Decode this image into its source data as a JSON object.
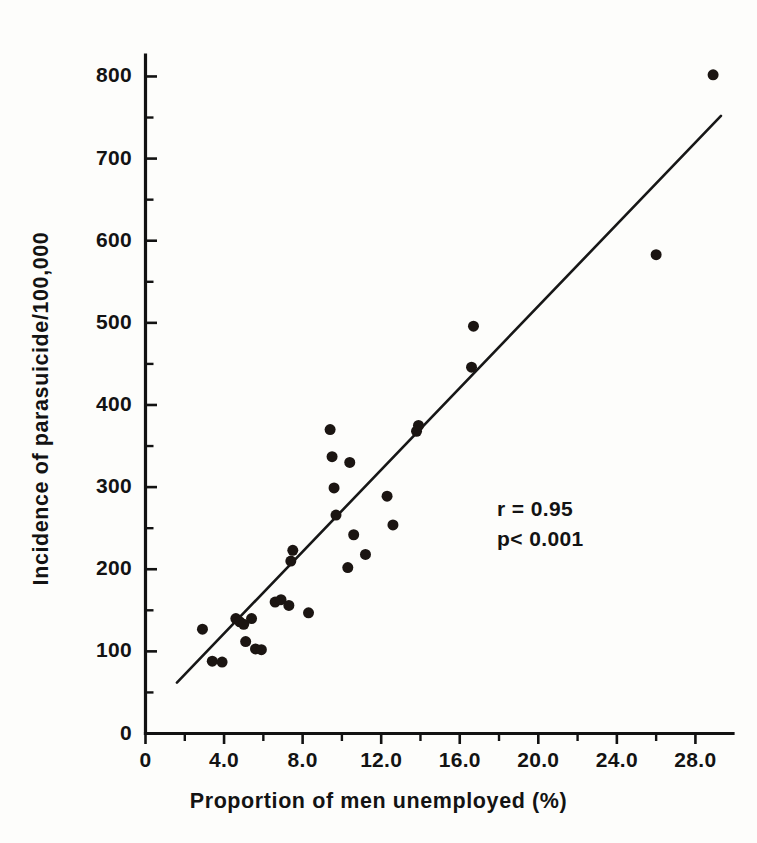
{
  "figure": {
    "background_color": "#fdfdfb",
    "ink_color": "#131313"
  },
  "annotations": {
    "correlation": "r = 0.95",
    "pvalue": "p< 0.001"
  },
  "axes": {
    "y_title": "Incidence of parasuicide/100,000",
    "x_title": "Proportion of men unemployed (%)",
    "y_ticks": [
      "0",
      "100",
      "200",
      "300",
      "400",
      "500",
      "600",
      "700",
      "800"
    ],
    "x_ticks": [
      "0",
      "4.0",
      "8.0",
      "12.0",
      "16.0",
      "20.0",
      "24.0",
      "28.0"
    ]
  },
  "chart_data": {
    "type": "scatter",
    "title": "",
    "xlabel": "Proportion of men unemployed (%)",
    "ylabel": "Incidence of parasuicide/100,000",
    "xlim": [
      0,
      30
    ],
    "ylim": [
      0,
      850
    ],
    "grid": false,
    "legend": "none",
    "x_ticks": [
      0,
      4,
      8,
      12,
      16,
      20,
      24,
      28
    ],
    "x_tick_labels": [
      "0",
      "4.0",
      "8.0",
      "12.0",
      "16.0",
      "20.0",
      "24.0",
      "28.0"
    ],
    "x_minor_tick_step": 2,
    "y_ticks": [
      0,
      100,
      200,
      300,
      400,
      500,
      600,
      700,
      800
    ],
    "y_tick_labels": [
      "0",
      "100",
      "200",
      "300",
      "400",
      "500",
      "600",
      "700",
      "800"
    ],
    "y_minor_tick_step": 50,
    "marker": "filled-circle",
    "marker_color": "#1b1512",
    "marker_size_px": 11,
    "points": [
      {
        "x": 2.9,
        "y": 127
      },
      {
        "x": 3.4,
        "y": 88
      },
      {
        "x": 3.9,
        "y": 87
      },
      {
        "x": 4.6,
        "y": 140
      },
      {
        "x": 4.8,
        "y": 136
      },
      {
        "x": 5.0,
        "y": 133
      },
      {
        "x": 5.1,
        "y": 112
      },
      {
        "x": 5.6,
        "y": 103
      },
      {
        "x": 5.9,
        "y": 102
      },
      {
        "x": 5.4,
        "y": 140
      },
      {
        "x": 6.6,
        "y": 160
      },
      {
        "x": 6.9,
        "y": 163
      },
      {
        "x": 7.3,
        "y": 156
      },
      {
        "x": 7.5,
        "y": 223
      },
      {
        "x": 7.4,
        "y": 210
      },
      {
        "x": 8.3,
        "y": 147
      },
      {
        "x": 9.4,
        "y": 370
      },
      {
        "x": 9.5,
        "y": 337
      },
      {
        "x": 9.6,
        "y": 299
      },
      {
        "x": 9.7,
        "y": 266
      },
      {
        "x": 10.4,
        "y": 330
      },
      {
        "x": 10.6,
        "y": 242
      },
      {
        "x": 10.3,
        "y": 202
      },
      {
        "x": 11.2,
        "y": 218
      },
      {
        "x": 12.3,
        "y": 289
      },
      {
        "x": 12.6,
        "y": 254
      },
      {
        "x": 13.9,
        "y": 375
      },
      {
        "x": 13.8,
        "y": 368
      },
      {
        "x": 16.7,
        "y": 496
      },
      {
        "x": 16.6,
        "y": 446
      },
      {
        "x": 26.0,
        "y": 583
      },
      {
        "x": 28.9,
        "y": 802
      }
    ],
    "fit_line": {
      "label": "least-squares regression line",
      "x_start": 1.6,
      "y_start": 62,
      "x_end": 29.3,
      "y_end": 752
    },
    "statistics": {
      "r": "r = 0.95",
      "p": "p< 0.001"
    }
  }
}
